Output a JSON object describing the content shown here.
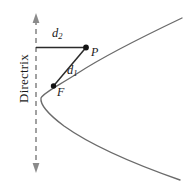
{
  "figure": {
    "kind": "parabola-focus-directrix-diagram",
    "background_color": "#ffffff",
    "stroke_color": "#5a5a5a",
    "accent_color": "#1a1a1a",
    "width": 183,
    "height": 184
  },
  "labels": {
    "directrix": "Directrix",
    "d2": "d",
    "d2_sub": "2",
    "d1": "d",
    "d1_sub": "1",
    "point_p": "P",
    "point_f": "F"
  },
  "geometry": {
    "directrix_x": 36,
    "directrix_top_y": 14,
    "directrix_bottom_y": 172,
    "vertex": [
      41,
      95
    ],
    "focus": [
      53,
      86
    ],
    "point_p": [
      86,
      47
    ],
    "d2_segment": [
      [
        36,
        47
      ],
      [
        86,
        47
      ]
    ],
    "d1_segment": [
      [
        53,
        86
      ],
      [
        86,
        47
      ]
    ]
  }
}
